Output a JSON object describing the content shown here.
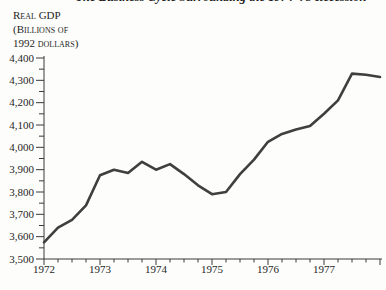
{
  "chart": {
    "title": "The Business Cycle Surrounding the 1974–75 Recession",
    "title_cropped": true,
    "y_unit_label_lines": [
      "Real GDP",
      "(Billions of",
      "1992 dollars)"
    ]
  },
  "chart_data": {
    "type": "line",
    "title": "The Business Cycle Surrounding the 1974–75 Recession",
    "ylabel": "Real GDP (Billions of 1992 dollars)",
    "xlabel": "",
    "legend": "none",
    "grid": false,
    "line_color": "#3f3f3f",
    "background": "#fdfdfb",
    "ylim": [
      3500,
      4400
    ],
    "y_major_tick_step": 100,
    "y_minor_tick_step": 50,
    "y_ticks": [
      3500,
      3600,
      3700,
      3800,
      3900,
      4000,
      4100,
      4200,
      4300,
      4400
    ],
    "y_tick_labels": [
      "3,500",
      "3,600",
      "3,700",
      "3,800",
      "3,900",
      "4,000",
      "4,100",
      "4,200",
      "4,300",
      "4,400"
    ],
    "x_year_labels": [
      "1972",
      "1973",
      "1974",
      "1975",
      "1976",
      "1977"
    ],
    "x_minor_tick_unit": "quarter",
    "series": [
      {
        "name": "Real GDP",
        "x": [
          "1972Q1",
          "1972Q2",
          "1972Q3",
          "1972Q4",
          "1973Q1",
          "1973Q2",
          "1973Q3",
          "1973Q4",
          "1974Q1",
          "1974Q2",
          "1974Q3",
          "1974Q4",
          "1975Q1",
          "1975Q2",
          "1975Q3",
          "1975Q4",
          "1976Q1",
          "1976Q2",
          "1976Q3",
          "1976Q4",
          "1977Q1",
          "1977Q2",
          "1977Q3",
          "1977Q4",
          "1978Q1"
        ],
        "values": [
          3575,
          3640,
          3675,
          3740,
          3875,
          3900,
          3885,
          3935,
          3900,
          3925,
          3880,
          3830,
          3790,
          3800,
          3880,
          3945,
          4025,
          4060,
          4080,
          4095,
          4150,
          4210,
          4330,
          4325,
          4315
        ]
      }
    ]
  }
}
